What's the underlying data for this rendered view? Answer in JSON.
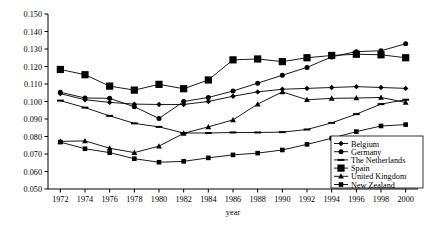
{
  "chart_data": {
    "type": "line",
    "title": "",
    "xlabel": "year",
    "ylabel": "",
    "xlim": [
      1971,
      2001
    ],
    "ylim": [
      0.05,
      0.15
    ],
    "grid": false,
    "legend_position": "bottom-right",
    "x": [
      1972,
      1974,
      1976,
      1978,
      1980,
      1982,
      1984,
      1986,
      1988,
      1990,
      1992,
      1994,
      1996,
      1998,
      2000
    ],
    "xticklabels": [
      "1972",
      "1974",
      "1976",
      "1978",
      "1980",
      "1982",
      "1984",
      "1986",
      "1988",
      "1990",
      "1992",
      "1994",
      "1996",
      "1998",
      "2000"
    ],
    "yticklabels": [
      "0.050",
      "0.060",
      "0.070",
      "0.080",
      "0.090",
      "0.100",
      "0.110",
      "0.120",
      "0.130",
      "0.140",
      "0.150"
    ],
    "yticks": [
      0.05,
      0.06,
      0.07,
      0.08,
      0.09,
      0.1,
      0.11,
      0.12,
      0.13,
      0.14,
      0.15
    ],
    "series": [
      {
        "name": "Belgium",
        "marker": "diamond",
        "values": [
          0.1045,
          0.101,
          0.0995,
          0.0985,
          0.0983,
          0.0983,
          0.1,
          0.103,
          0.1055,
          0.107,
          0.1075,
          0.108,
          0.1085,
          0.108,
          0.1075
        ]
      },
      {
        "name": "Germany",
        "marker": "circle",
        "values": [
          0.1053,
          0.102,
          0.1018,
          0.097,
          0.0903,
          0.1,
          0.1023,
          0.106,
          0.1105,
          0.115,
          0.1195,
          0.1255,
          0.1285,
          0.129,
          0.133
        ]
      },
      {
        "name": "The Netherlands",
        "marker": "dash",
        "values": [
          0.1005,
          0.0965,
          0.0918,
          0.0875,
          0.0855,
          0.082,
          0.082,
          0.0823,
          0.0823,
          0.0825,
          0.084,
          0.0878,
          0.0928,
          0.0985,
          0.101
        ]
      },
      {
        "name": "Spain",
        "marker": "square-large",
        "values": [
          0.1183,
          0.1153,
          0.1088,
          0.1065,
          0.1098,
          0.1073,
          0.1123,
          0.1238,
          0.1243,
          0.1228,
          0.125,
          0.1263,
          0.127,
          0.1267,
          0.125
        ]
      },
      {
        "name": "United Kingdom",
        "marker": "triangle",
        "values": [
          0.0772,
          0.0775,
          0.0733,
          0.0708,
          0.0745,
          0.0818,
          0.0855,
          0.0895,
          0.0985,
          0.1055,
          0.101,
          0.1018,
          0.102,
          0.1023,
          0.0995
        ]
      },
      {
        "name": "New Zealand",
        "marker": "square-small",
        "values": [
          0.0768,
          0.073,
          0.0708,
          0.0673,
          0.0653,
          0.0658,
          0.0678,
          0.0695,
          0.0705,
          0.0723,
          0.0755,
          0.079,
          0.0828,
          0.086,
          0.0868
        ]
      }
    ]
  },
  "legend": {
    "items": [
      {
        "label": "Belgium"
      },
      {
        "label": "Germany"
      },
      {
        "label": "The Netherlands"
      },
      {
        "label": "Spain"
      },
      {
        "label": "United Kingdom"
      },
      {
        "label": "New Zealand"
      }
    ]
  }
}
